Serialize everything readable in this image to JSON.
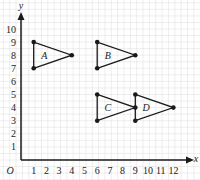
{
  "diagram": {
    "type": "coordinate-grid",
    "axes": {
      "x_label": "x",
      "y_label": "y",
      "origin_label": "O",
      "x_ticks": [
        "1",
        "2",
        "3",
        "4",
        "5",
        "6",
        "7",
        "8",
        "9",
        "10",
        "11",
        "12"
      ],
      "y_ticks": [
        "1",
        "2",
        "3",
        "4",
        "5",
        "6",
        "7",
        "8",
        "9",
        "10"
      ]
    },
    "triangles": [
      {
        "label": "A",
        "vertices": [
          [
            1,
            9
          ],
          [
            1,
            7
          ],
          [
            4,
            8
          ]
        ]
      },
      {
        "label": "B",
        "vertices": [
          [
            6,
            9
          ],
          [
            6,
            7
          ],
          [
            9,
            8
          ]
        ]
      },
      {
        "label": "C",
        "vertices": [
          [
            6,
            5
          ],
          [
            6,
            3
          ],
          [
            9,
            4
          ]
        ]
      },
      {
        "label": "D",
        "vertices": [
          [
            9,
            5
          ],
          [
            9,
            3
          ],
          [
            12,
            4
          ]
        ]
      }
    ],
    "colors": {
      "grid": "#dcdcdc",
      "line": "#1a1a1a"
    }
  }
}
